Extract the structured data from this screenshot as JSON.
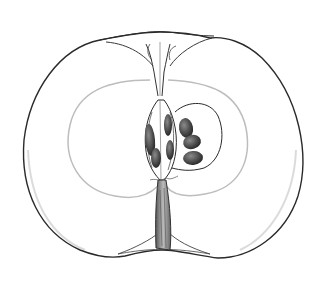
{
  "illustration": {
    "subject": "apple cross-section",
    "style": "pencil botanical drawing",
    "background_color": "#ffffff",
    "outline_color": "#2a2a2a",
    "flesh_color": "#ffffff",
    "core_line_color": "#bdbdbd",
    "seed_color": "#3a3a3a",
    "parts": [
      "skin-outline",
      "calyx",
      "core-line",
      "carpel",
      "seeds",
      "stem"
    ]
  }
}
